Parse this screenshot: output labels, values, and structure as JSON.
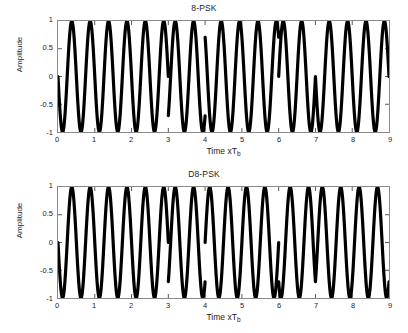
{
  "figure": {
    "width": 408,
    "height": 333,
    "background": "#ffffff",
    "axis_color": "#8a8a8a",
    "line_color": "#000000"
  },
  "panels": [
    {
      "id": "panel-top",
      "title": "8-PSK",
      "xlabel_main": "Time xT",
      "xlabel_sub": "b",
      "ylabel": "Amplitude"
    },
    {
      "id": "panel-bot",
      "title": "D8-PSK",
      "xlabel_main": "Time xT",
      "xlabel_sub": "b",
      "ylabel": "Amplitude"
    }
  ],
  "axis": {
    "xticks": [
      "0",
      "1",
      "2",
      "3",
      "4",
      "5",
      "6",
      "7",
      "8",
      "9"
    ],
    "yticks": [
      "1",
      "0.5",
      "0",
      "-0.5",
      "-1"
    ]
  },
  "chart_data": [
    {
      "type": "line",
      "title": "8-PSK",
      "xlabel": "Time xTb",
      "ylabel": "Amplitude",
      "xlim": [
        0,
        9
      ],
      "ylim": [
        -1,
        1
      ],
      "xticks": [
        0,
        1,
        2,
        3,
        4,
        5,
        6,
        7,
        8,
        9
      ],
      "yticks": [
        -1,
        -0.5,
        0,
        0.5,
        1
      ],
      "grid": false,
      "legend": null,
      "description": "8-PSK modulated carrier: unit-amplitude sinusoid, 2 cycles per symbol interval, with abrupt absolute phase changes at symbol boundaries",
      "carrier_cycles_per_symbol": 2,
      "symbol_duration": 1,
      "series": [
        {
          "name": "8-PSK waveform",
          "color": "#000000",
          "marker": "dot",
          "symbol_phases_pi_over_4": [
            2,
            2,
            2,
            5,
            1,
            1,
            6,
            2,
            2
          ],
          "samples_per_symbol": 200
        }
      ]
    },
    {
      "type": "line",
      "title": "D8-PSK",
      "xlabel": "Time xTb",
      "ylabel": "Amplitude",
      "xlim": [
        0,
        9
      ],
      "ylim": [
        -1,
        1
      ],
      "xticks": [
        0,
        1,
        2,
        3,
        4,
        5,
        6,
        7,
        8,
        9
      ],
      "yticks": [
        -1,
        -0.5,
        0,
        0.5,
        1
      ],
      "grid": false,
      "legend": null,
      "description": "Differentially encoded 8-PSK carrier: phase accumulates differentially across symbol intervals, producing smaller discontinuities",
      "carrier_cycles_per_symbol": 2,
      "symbol_duration": 1,
      "series": [
        {
          "name": "D8-PSK waveform",
          "color": "#000000",
          "marker": "dot",
          "symbol_phases_pi_over_4": [
            2,
            2,
            2,
            5,
            6,
            6,
            3,
            5,
            5
          ],
          "samples_per_symbol": 200
        }
      ]
    }
  ]
}
